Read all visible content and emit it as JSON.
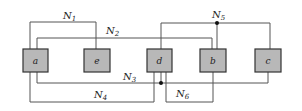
{
  "blocks": [
    {
      "id": "a",
      "label": "a"
    },
    {
      "id": "e",
      "label": "e"
    },
    {
      "id": "d",
      "label": "d"
    },
    {
      "id": "b",
      "label": "b"
    },
    {
      "id": "c",
      "label": "c"
    }
  ],
  "nets": [
    {
      "label": "N",
      "sub": "1"
    },
    {
      "label": "N",
      "sub": "2"
    },
    {
      "label": "N",
      "sub": "3"
    },
    {
      "label": "N",
      "sub": "4"
    },
    {
      "label": "N",
      "sub": "5"
    },
    {
      "label": "N",
      "sub": "6"
    }
  ]
}
